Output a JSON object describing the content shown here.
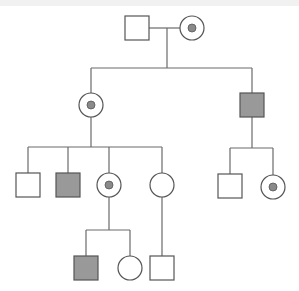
{
  "diagram": {
    "type": "pedigree",
    "colors": {
      "line": "#6a6a6a",
      "outline": "#555555",
      "unaffected_fill": "#ffffff",
      "affected_fill": "#999999",
      "carrier_dot": "#8a8a8a"
    },
    "symbol_size": 24,
    "generations": [
      {
        "label": "I",
        "individuals": [
          {
            "id": "I-1",
            "sex": "male",
            "status": "unaffected",
            "cx": 137,
            "cy": 28
          },
          {
            "id": "I-2",
            "sex": "female",
            "status": "carrier",
            "cx": 192,
            "cy": 28
          }
        ]
      },
      {
        "label": "II",
        "individuals": [
          {
            "id": "II-1",
            "sex": "female",
            "status": "carrier",
            "cx": 91,
            "cy": 105
          },
          {
            "id": "II-2",
            "sex": "male",
            "status": "affected",
            "cx": 252,
            "cy": 105
          }
        ]
      },
      {
        "label": "III",
        "individuals": [
          {
            "id": "III-1",
            "sex": "male",
            "status": "unaffected",
            "cx": 28,
            "cy": 185
          },
          {
            "id": "III-2",
            "sex": "male",
            "status": "affected",
            "cx": 68,
            "cy": 185
          },
          {
            "id": "III-3",
            "sex": "female",
            "status": "carrier",
            "cx": 109,
            "cy": 185
          },
          {
            "id": "III-4",
            "sex": "female",
            "status": "unaffected",
            "cx": 162,
            "cy": 185
          },
          {
            "id": "III-5",
            "sex": "male",
            "status": "unaffected",
            "cx": 230,
            "cy": 186
          },
          {
            "id": "III-6",
            "sex": "female",
            "status": "carrier",
            "cx": 273,
            "cy": 187
          }
        ]
      },
      {
        "label": "IV",
        "individuals": [
          {
            "id": "IV-1",
            "sex": "male",
            "status": "affected",
            "cx": 86,
            "cy": 268
          },
          {
            "id": "IV-2",
            "sex": "female",
            "status": "unaffected",
            "cx": 130,
            "cy": 268
          },
          {
            "id": "IV-3",
            "sex": "male",
            "status": "unaffected",
            "cx": 162,
            "cy": 268
          }
        ]
      }
    ],
    "lines": [
      {
        "name": "mating-line-I",
        "x1": 149,
        "y1": 28,
        "x2": 180,
        "y2": 28
      },
      {
        "name": "descent-line-I",
        "x1": 167,
        "y1": 28,
        "x2": 167,
        "y2": 68
      },
      {
        "name": "sibship-line-II",
        "x1": 91,
        "y1": 68,
        "x2": 252,
        "y2": 68
      },
      {
        "name": "drop-II-1",
        "x1": 91,
        "y1": 68,
        "x2": 91,
        "y2": 93
      },
      {
        "name": "drop-II-2",
        "x1": 252,
        "y1": 68,
        "x2": 252,
        "y2": 93
      },
      {
        "name": "descent-line-II-1",
        "x1": 91,
        "y1": 117,
        "x2": 91,
        "y2": 147
      },
      {
        "name": "sibship-line-III-left",
        "x1": 28,
        "y1": 147,
        "x2": 162,
        "y2": 147
      },
      {
        "name": "drop-III-1",
        "x1": 28,
        "y1": 147,
        "x2": 28,
        "y2": 173
      },
      {
        "name": "drop-III-2",
        "x1": 68,
        "y1": 147,
        "x2": 68,
        "y2": 173
      },
      {
        "name": "drop-III-3",
        "x1": 109,
        "y1": 147,
        "x2": 109,
        "y2": 173
      },
      {
        "name": "drop-III-4",
        "x1": 162,
        "y1": 147,
        "x2": 162,
        "y2": 173
      },
      {
        "name": "descent-line-II-2",
        "x1": 252,
        "y1": 117,
        "x2": 252,
        "y2": 148
      },
      {
        "name": "sibship-line-III-right",
        "x1": 230,
        "y1": 148,
        "x2": 273,
        "y2": 148
      },
      {
        "name": "drop-III-5",
        "x1": 230,
        "y1": 148,
        "x2": 230,
        "y2": 174
      },
      {
        "name": "drop-III-6",
        "x1": 273,
        "y1": 148,
        "x2": 273,
        "y2": 175
      },
      {
        "name": "descent-line-III-3",
        "x1": 109,
        "y1": 197,
        "x2": 109,
        "y2": 230
      },
      {
        "name": "sibship-line-IV-left",
        "x1": 86,
        "y1": 230,
        "x2": 130,
        "y2": 230
      },
      {
        "name": "drop-IV-1",
        "x1": 86,
        "y1": 230,
        "x2": 86,
        "y2": 256
      },
      {
        "name": "drop-IV-2",
        "x1": 130,
        "y1": 230,
        "x2": 130,
        "y2": 256
      },
      {
        "name": "descent-line-III-4",
        "x1": 162,
        "y1": 197,
        "x2": 162,
        "y2": 256
      }
    ]
  }
}
